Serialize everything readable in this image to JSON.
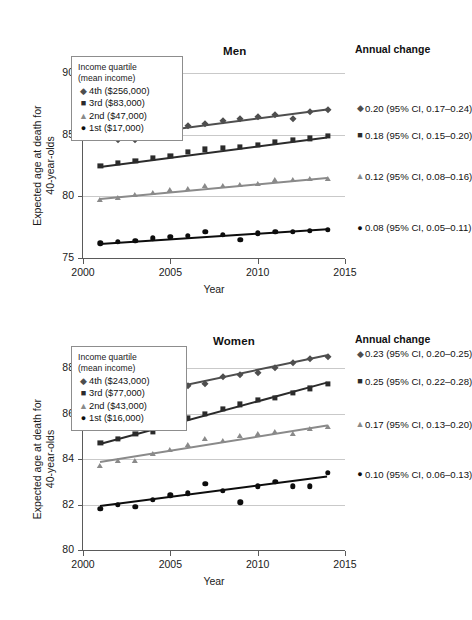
{
  "figure": {
    "axis_title_y": "Expected age at death for\n40-year-olds",
    "axis_title_x": "Year"
  },
  "chart_data": [
    {
      "type": "scatter",
      "title": "Men",
      "xlabel": "Year",
      "ylabel": "Expected age at death for 40-year-olds",
      "xlim": [
        2000,
        2015
      ],
      "ylim": [
        75,
        90
      ],
      "xticks": [
        2000,
        2005,
        2010,
        2015
      ],
      "yticks": [
        75,
        80,
        85,
        90
      ],
      "grid": "horizontal",
      "legend_position": "top-left",
      "legend_title": "Income quartile\n(mean income)",
      "annual_change_header": "Annual change",
      "x": [
        2001,
        2002,
        2003,
        2004,
        2005,
        2006,
        2007,
        2008,
        2009,
        2010,
        2011,
        2012,
        2013,
        2014
      ],
      "series": [
        {
          "name": "4th ($256,000)",
          "marker": "diamond",
          "color": "#4e4e4e",
          "values": [
            84.8,
            84.6,
            84.6,
            85.2,
            85.4,
            85.7,
            85.9,
            86.1,
            86.3,
            86.4,
            86.6,
            86.3,
            86.8,
            87.0
          ],
          "trend": [
            84.7,
            87.1
          ],
          "annual_change": "0.20 (95% CI, 0.17–0.24)"
        },
        {
          "name": "3rd ($83,000)",
          "marker": "square",
          "color": "#2b2b2b",
          "values": [
            82.5,
            82.7,
            82.9,
            83.1,
            83.3,
            83.6,
            83.8,
            83.9,
            84.0,
            84.2,
            84.4,
            84.6,
            84.7,
            84.9
          ],
          "trend": [
            82.5,
            84.9
          ],
          "annual_change": "0.18 (95% CI, 0.15–0.20)"
        },
        {
          "name": "2nd ($47,000)",
          "marker": "triangle",
          "color": "#8a8a8a",
          "values": [
            79.7,
            79.9,
            80.1,
            80.3,
            80.5,
            80.6,
            80.8,
            80.8,
            80.9,
            81.0,
            81.3,
            81.3,
            81.4,
            81.4
          ],
          "trend": [
            79.9,
            81.6
          ],
          "annual_change": "0.12 (95% CI, 0.08–0.16)"
        },
        {
          "name": "1st ($17,000)",
          "marker": "circle",
          "color": "#0d0d0d",
          "values": [
            76.2,
            76.3,
            76.4,
            76.6,
            76.7,
            76.8,
            77.1,
            76.9,
            76.5,
            77.0,
            77.1,
            77.1,
            77.2,
            77.3
          ],
          "trend": [
            76.2,
            77.4
          ],
          "annual_change": "0.08 (95% CI, 0.05–0.11)"
        }
      ]
    },
    {
      "type": "scatter",
      "title": "Women",
      "xlabel": "Year",
      "ylabel": "Expected age at death for 40-year-olds",
      "xlim": [
        2000,
        2015
      ],
      "ylim": [
        80,
        88
      ],
      "xticks": [
        2000,
        2005,
        2010,
        2015
      ],
      "yticks": [
        80,
        82,
        84,
        86,
        88
      ],
      "grid": "horizontal",
      "legend_position": "top-left",
      "legend_title": "Income quartile\n(mean income)",
      "annual_change_header": "Annual change",
      "x": [
        2001,
        2002,
        2003,
        2004,
        2005,
        2006,
        2007,
        2008,
        2009,
        2010,
        2011,
        2012,
        2013,
        2014
      ],
      "series": [
        {
          "name": "4th ($243,000)",
          "marker": "diamond",
          "color": "#4e4e4e",
          "values": [
            86.5,
            86.5,
            86.7,
            86.9,
            87.0,
            87.2,
            87.3,
            87.6,
            87.7,
            87.8,
            88.0,
            88.2,
            88.4,
            88.5
          ],
          "trend": [
            86.5,
            88.6
          ],
          "annual_change": "0.23 (95% CI, 0.20–0.25)"
        },
        {
          "name": "3rd ($77,000)",
          "marker": "square",
          "color": "#2b2b2b",
          "values": [
            84.7,
            84.9,
            85.1,
            85.2,
            85.5,
            85.8,
            86.0,
            86.2,
            86.4,
            86.6,
            86.7,
            86.9,
            87.1,
            87.3
          ],
          "trend": [
            84.7,
            87.4
          ],
          "annual_change": "0.25 (95% CI, 0.22–0.28)"
        },
        {
          "name": "2nd ($43,000)",
          "marker": "triangle",
          "color": "#8a8a8a",
          "values": [
            83.7,
            83.9,
            83.9,
            84.2,
            84.4,
            84.6,
            84.9,
            84.8,
            85.0,
            85.1,
            85.2,
            85.1,
            85.3,
            85.4
          ],
          "trend": [
            83.9,
            85.5
          ],
          "annual_change": "0.17 (95% CI, 0.13–0.20)"
        },
        {
          "name": "1st ($16,000)",
          "marker": "circle",
          "color": "#0d0d0d",
          "values": [
            81.8,
            82.0,
            81.9,
            82.2,
            82.4,
            82.5,
            82.9,
            82.6,
            82.1,
            82.8,
            83.0,
            82.8,
            82.8,
            83.4
          ],
          "trend": [
            82.0,
            83.3
          ],
          "annual_change": "0.10 (95% CI, 0.06–0.13)"
        }
      ]
    }
  ]
}
